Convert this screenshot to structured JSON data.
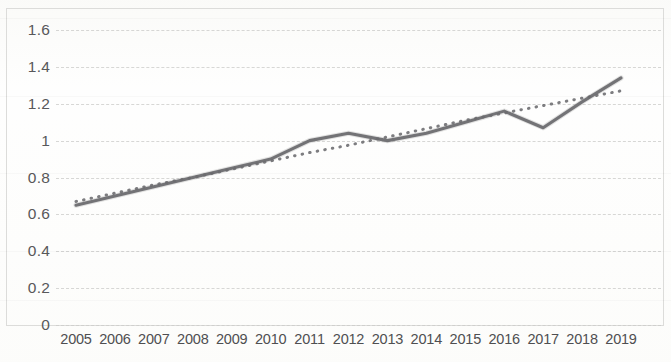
{
  "chart_data": {
    "type": "line",
    "title": "",
    "subtitle": "",
    "xlabel": "",
    "ylabel": "",
    "categories": [
      "2005",
      "2006",
      "2007",
      "2008",
      "2009",
      "2010",
      "2011",
      "2012",
      "2013",
      "2014",
      "2015",
      "2016",
      "2017",
      "2018",
      "2019"
    ],
    "series": [
      {
        "name": "data-line",
        "style": "solid",
        "color": "#6b6b6e",
        "values": [
          0.65,
          0.7,
          0.75,
          0.8,
          0.85,
          0.9,
          1.0,
          1.04,
          1.0,
          1.04,
          1.1,
          1.16,
          1.07,
          1.21,
          1.34
        ]
      },
      {
        "name": "trendline",
        "style": "dotted",
        "color": "#6f6f72",
        "values": [
          0.67,
          0.715,
          0.76,
          0.8,
          0.845,
          0.89,
          0.935,
          0.975,
          1.02,
          1.065,
          1.11,
          1.15,
          1.19,
          1.23,
          1.27
        ]
      }
    ],
    "ylim": [
      0,
      1.6
    ],
    "yticks": [
      0,
      0.2,
      0.4,
      0.6,
      0.8,
      1,
      1.2,
      1.4,
      1.6
    ],
    "ytick_labels": [
      "0",
      "0.2",
      "0.4",
      "0.6",
      "0.8",
      "1",
      "1.2",
      "1.4",
      "1.6"
    ],
    "grid": true,
    "grid_axis": "y",
    "grid_style": "dashed",
    "legend": false,
    "legend_position": "none",
    "annotations": [],
    "plot_border": true,
    "background_color": "#ffffff",
    "gridline_color": "#d5d5d3",
    "axis_text_color": "#58585a"
  }
}
